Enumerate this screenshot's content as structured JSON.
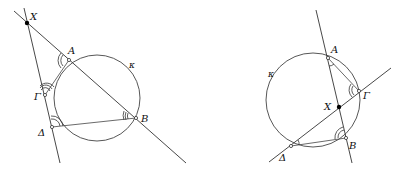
{
  "figures": [
    {
      "id": "left",
      "circle_label": "κ",
      "points": {
        "X": {
          "label": "X",
          "x": 27,
          "y": 23
        },
        "A": {
          "label": "A",
          "x": 69,
          "y": 60
        },
        "Gamma": {
          "label": "Γ",
          "x": 45,
          "y": 95
        },
        "Delta": {
          "label": "Δ",
          "x": 52,
          "y": 127
        },
        "B": {
          "label": "B",
          "x": 136,
          "y": 118
        }
      }
    },
    {
      "id": "right",
      "circle_label": "κ",
      "points": {
        "A": {
          "label": "A",
          "x": 328,
          "y": 58
        },
        "Gamma": {
          "label": "Γ",
          "x": 359,
          "y": 91
        },
        "X": {
          "label": "X",
          "x": 339,
          "y": 107
        },
        "B": {
          "label": "B",
          "x": 346,
          "y": 138
        },
        "Delta": {
          "label": "Δ",
          "x": 291,
          "y": 146
        }
      }
    }
  ],
  "colors": {
    "stroke": "#333333",
    "background": "#ffffff"
  }
}
